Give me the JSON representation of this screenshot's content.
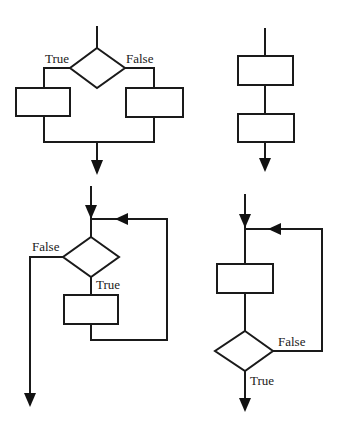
{
  "diagram": {
    "colors": {
      "stroke": "#1a1a1a",
      "background": "#ffffff"
    },
    "structures": [
      {
        "id": "selection",
        "kind": "if-else",
        "labels": {
          "true": "True",
          "false": "False"
        }
      },
      {
        "id": "sequence",
        "kind": "sequence",
        "labels": {}
      },
      {
        "id": "while-loop",
        "kind": "pre-test-loop",
        "labels": {
          "true": "True",
          "false": "False"
        }
      },
      {
        "id": "do-while-loop",
        "kind": "post-test-loop",
        "labels": {
          "true": "True",
          "false": "False"
        }
      }
    ]
  }
}
